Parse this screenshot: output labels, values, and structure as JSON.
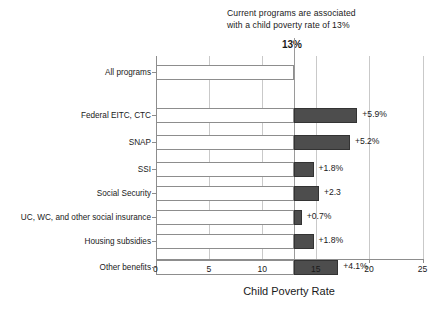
{
  "annotation": {
    "line1": "Current programs are associated",
    "line2": "with a child poverty rate of 13%",
    "marker_value": "13%"
  },
  "axis": {
    "xlabel": "Child Poverty Rate",
    "xticks": [
      "0",
      "5",
      "10",
      "15",
      "20",
      "25"
    ]
  },
  "colors": {
    "bar_base_fill": "#ffffff",
    "bar_base_border": "#8d8d8d",
    "bar_delta_fill": "#4d4d4d",
    "bar_delta_border": "#333333",
    "gridline": "#c9c9c9",
    "axis": "#8d8d8d",
    "text": "#1a1a1a"
  },
  "chart_data": {
    "type": "bar",
    "orientation": "horizontal",
    "title": "",
    "subtitle": "Current programs are associated with a child poverty rate of 13%",
    "xlabel": "Child Poverty Rate",
    "ylabel": "",
    "xlim": [
      0,
      25
    ],
    "xticks": [
      0,
      5,
      10,
      15,
      20,
      25
    ],
    "grid": true,
    "legend": null,
    "baseline": 13,
    "baseline_label": "13%",
    "categories": [
      "All programs",
      "Federal EITC, CTC",
      "SNAP",
      "SSI",
      "Social Security",
      "UC, WC, and other social insurance",
      "Housing subsidies",
      "Other benefits"
    ],
    "series": [
      {
        "name": "Child poverty rate with current programs",
        "values": [
          13,
          13,
          13,
          13,
          13,
          13,
          13,
          13
        ]
      },
      {
        "name": "Increase in child poverty rate if program removed",
        "values": [
          0,
          5.9,
          5.2,
          1.8,
          2.3,
          0.7,
          1.8,
          4.1
        ]
      }
    ],
    "data_labels": [
      "",
      "+5.9%",
      "+5.2%",
      "+1.8%",
      "+2.3",
      "+0.7%",
      "+1.8%",
      "+4.1%"
    ],
    "totals": [
      13,
      18.9,
      18.2,
      14.8,
      15.3,
      13.7,
      14.8,
      17.1
    ]
  },
  "rows": [
    {
      "label": "All programs",
      "base": 13,
      "delta": 0,
      "value_label": "",
      "y": 9
    },
    {
      "label": "Federal EITC, CTC",
      "base": 13,
      "delta": 5.9,
      "value_label": "+5.9%",
      "y": 52
    },
    {
      "label": "SNAP",
      "base": 13,
      "delta": 5.2,
      "value_label": "+5.2%",
      "y": 79
    },
    {
      "label": "SSI",
      "base": 13,
      "delta": 1.8,
      "value_label": "+1.8%",
      "y": 106
    },
    {
      "label": "Social Security",
      "base": 13,
      "delta": 2.3,
      "value_label": "+2.3",
      "y": 130
    },
    {
      "label": "UC, WC, and other social insurance",
      "base": 13,
      "delta": 0.7,
      "value_label": "+0.7%",
      "y": 154
    },
    {
      "label": "Housing subsidies",
      "base": 13,
      "delta": 1.8,
      "value_label": "+1.8%",
      "y": 178
    },
    {
      "label": "Other benefits",
      "base": 13,
      "delta": 4.1,
      "value_label": "+4.1%",
      "y": 204
    }
  ]
}
